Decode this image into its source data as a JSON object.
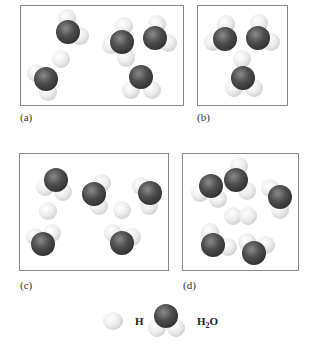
{
  "panels": [
    {
      "id": "a",
      "label": "(a)",
      "box": [
        20,
        5,
        164,
        101
      ],
      "label_pos": [
        20,
        111
      ]
    },
    {
      "id": "b",
      "label": "(b)",
      "box": [
        197,
        5,
        91,
        101
      ],
      "label_pos": [
        197,
        111
      ]
    },
    {
      "id": "c",
      "label": "(c)",
      "box": [
        19,
        153,
        150,
        118
      ],
      "label_pos": [
        20,
        279
      ]
    },
    {
      "id": "d",
      "label": "(d)",
      "box": [
        182,
        153,
        117,
        118
      ],
      "label_pos": [
        183,
        279
      ]
    }
  ],
  "molecules": {
    "a": {
      "h_atoms": [
        [
          61,
          59
        ],
        [
          126,
          58
        ]
      ],
      "water": [
        {
          "o": [
            68,
            32
          ],
          "h": [
            [
              67,
              18
            ],
            [
              80,
              36
            ]
          ]
        },
        {
          "o": [
            46,
            79
          ],
          "h": [
            [
              36,
              73
            ],
            [
              48,
              92
            ]
          ]
        },
        {
          "o": [
            122,
            42
          ],
          "h": [
            [
              124,
              26
            ],
            [
              111,
              45
            ]
          ]
        },
        {
          "o": [
            155,
            38
          ],
          "h": [
            [
              157,
              24
            ],
            [
              168,
              43
            ]
          ]
        },
        {
          "o": [
            141,
            77
          ],
          "h": [
            [
              131,
              90
            ],
            [
              152,
              90
            ]
          ]
        }
      ]
    },
    "b": {
      "h_atoms": [
        [
          242,
          59
        ]
      ],
      "water": [
        {
          "o": [
            225,
            39
          ],
          "h": [
            [
              226,
              24
            ],
            [
              213,
              42
            ]
          ]
        },
        {
          "o": [
            258,
            38
          ],
          "h": [
            [
              259,
              23
            ],
            [
              271,
              42
            ]
          ]
        },
        {
          "o": [
            243,
            78
          ],
          "h": [
            [
              234,
              88
            ],
            [
              254,
              88
            ]
          ]
        }
      ]
    },
    "c": {
      "h_atoms": [
        [
          48,
          211
        ],
        [
          122,
          210
        ]
      ],
      "water": [
        {
          "o": [
            56,
            180
          ],
          "h": [
            [
              45,
              187
            ],
            [
              63,
              192
            ]
          ]
        },
        {
          "o": [
            94,
            194
          ],
          "h": [
            [
              102,
              183
            ],
            [
              99,
              206
            ]
          ]
        },
        {
          "o": [
            150,
            193
          ],
          "h": [
            [
              141,
              186
            ],
            [
              149,
              206
            ]
          ]
        },
        {
          "o": [
            43,
            244
          ],
          "h": [
            [
              35,
              237
            ],
            [
              52,
              233
            ]
          ]
        },
        {
          "o": [
            122,
            243
          ],
          "h": [
            [
              113,
              233
            ],
            [
              132,
              237
            ]
          ]
        }
      ]
    },
    "d": {
      "h_atoms": [
        [
          233,
          216
        ],
        [
          248,
          216
        ]
      ],
      "water": [
        {
          "o": [
            211,
            186
          ],
          "h": [
            [
              200,
              193
            ],
            [
              218,
              199
            ]
          ]
        },
        {
          "o": [
            236,
            180
          ],
          "h": [
            [
              239,
              166
            ],
            [
              247,
              191
            ]
          ]
        },
        {
          "o": [
            280,
            197
          ],
          "h": [
            [
              270,
              188
            ],
            [
              280,
              210
            ]
          ]
        },
        {
          "o": [
            213,
            245
          ],
          "h": [
            [
              210,
              232
            ],
            [
              228,
              247
            ]
          ]
        },
        {
          "o": [
            254,
            253
          ],
          "h": [
            [
              247,
              242
            ],
            [
              266,
              245
            ]
          ]
        }
      ]
    }
  },
  "legend": {
    "h_label": "H",
    "h2o_label_main": "H",
    "h2o_label_sub": "2",
    "h2o_label_end": "O",
    "h_atom_pos": [
      113,
      322
    ],
    "water": {
      "o": [
        166,
        316
      ],
      "h": [
        [
          157,
          328
        ],
        [
          176,
          328
        ]
      ]
    }
  },
  "colors": {
    "panel_border": "#8a8a8a",
    "oxygen": "#3a3a3a",
    "hydrogen": "#e6e6e6"
  }
}
